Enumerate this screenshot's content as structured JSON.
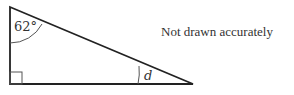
{
  "diagram": {
    "type": "right-triangle",
    "vertices": {
      "top": [
        10,
        7
      ],
      "right_angle": [
        10,
        84
      ],
      "acute": [
        193,
        84
      ]
    },
    "angles": {
      "top_label": "62°",
      "acute_label": "d",
      "right_angle_marker": true
    },
    "note": "Not drawn accurately",
    "colors": {
      "stroke": "#222222",
      "arc": "#555555",
      "text": "#333333"
    }
  }
}
